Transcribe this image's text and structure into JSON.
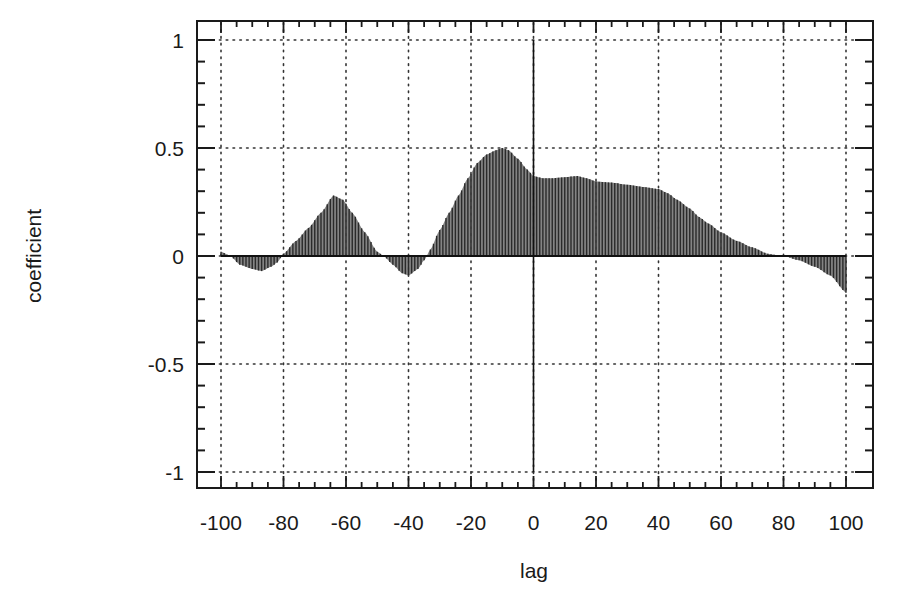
{
  "chart_data": {
    "type": "bar",
    "subtype": "impulse / stem plot (cross-correlation function)",
    "title": "",
    "xlabel": "lag",
    "ylabel": "coefficient",
    "xlim": [
      -100,
      100
    ],
    "ylim": [
      -1,
      1
    ],
    "x_ticks": [
      -100,
      -80,
      -60,
      -40,
      -20,
      0,
      20,
      40,
      60,
      80,
      100
    ],
    "x_tick_labels": [
      "-100",
      "-80",
      "-60",
      "-40",
      "-20",
      "0",
      "20",
      "40",
      "60",
      "80",
      "100"
    ],
    "y_ticks": [
      1,
      0.5,
      0,
      -0.5,
      -1
    ],
    "y_tick_labels": [
      "1",
      "0.5",
      "0",
      "-0.5",
      "-1"
    ],
    "grid": true,
    "grid_style": "dotted",
    "legend": null,
    "reference_lines": [
      {
        "axis": "x",
        "value": 0,
        "style": "solid"
      },
      {
        "axis": "y",
        "value": 0,
        "style": "solid"
      }
    ],
    "series": [
      {
        "name": "cross-correlation coefficient",
        "color": "#2a2a2a",
        "x": [
          -100,
          -97,
          -94,
          -90,
          -87,
          -84,
          -82,
          -80,
          -76,
          -72,
          -68,
          -64,
          -61,
          -58,
          -54,
          -50,
          -48,
          -45,
          -42,
          -40,
          -37,
          -35,
          -33,
          -30,
          -27,
          -24,
          -21,
          -18,
          -15,
          -12,
          -10,
          -8,
          -5,
          -2,
          0,
          3,
          6,
          10,
          14,
          17,
          20,
          25,
          30,
          35,
          40,
          43,
          46,
          50,
          53,
          56,
          60,
          65,
          70,
          75,
          80,
          85,
          90,
          95,
          100
        ],
        "values": [
          0.02,
          0.0,
          -0.04,
          -0.06,
          -0.07,
          -0.05,
          -0.03,
          0.01,
          0.07,
          0.13,
          0.2,
          0.28,
          0.26,
          0.2,
          0.11,
          0.02,
          0.0,
          -0.04,
          -0.08,
          -0.09,
          -0.06,
          -0.02,
          0.03,
          0.12,
          0.2,
          0.28,
          0.36,
          0.43,
          0.47,
          0.49,
          0.5,
          0.49,
          0.45,
          0.4,
          0.37,
          0.36,
          0.36,
          0.365,
          0.37,
          0.36,
          0.345,
          0.34,
          0.33,
          0.32,
          0.31,
          0.29,
          0.26,
          0.22,
          0.18,
          0.15,
          0.11,
          0.07,
          0.04,
          0.01,
          0.0,
          -0.02,
          -0.05,
          -0.09,
          -0.17
        ]
      }
    ]
  },
  "axes": {
    "xlabel": "lag",
    "ylabel": "coefficient"
  },
  "colors": {
    "frame": "#1a1a1a",
    "grid": "#333333",
    "bars": "#2a2a2a",
    "fill": "#6e6e6e",
    "background": "#ffffff"
  }
}
